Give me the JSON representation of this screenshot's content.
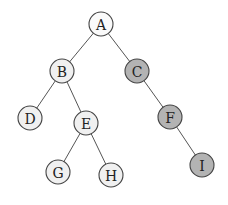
{
  "diagram": {
    "type": "binary-tree",
    "colors": {
      "light": "#f0f0f0",
      "root": "#fafafa",
      "dark": "#b3b3b3"
    },
    "nodes": [
      {
        "id": "A",
        "label": "A",
        "style": "root"
      },
      {
        "id": "B",
        "label": "B",
        "style": "light"
      },
      {
        "id": "C",
        "label": "C",
        "style": "dark"
      },
      {
        "id": "D",
        "label": "D",
        "style": "light"
      },
      {
        "id": "E",
        "label": "E",
        "style": "light"
      },
      {
        "id": "F",
        "label": "F",
        "style": "dark"
      },
      {
        "id": "G",
        "label": "G",
        "style": "light"
      },
      {
        "id": "H",
        "label": "H",
        "style": "light"
      },
      {
        "id": "I",
        "label": "I",
        "style": "dark"
      }
    ],
    "edges": [
      {
        "from": "A",
        "to": "B"
      },
      {
        "from": "A",
        "to": "C"
      },
      {
        "from": "B",
        "to": "D"
      },
      {
        "from": "B",
        "to": "E"
      },
      {
        "from": "C",
        "to": "F"
      },
      {
        "from": "E",
        "to": "G"
      },
      {
        "from": "E",
        "to": "H"
      },
      {
        "from": "F",
        "to": "I"
      }
    ]
  }
}
